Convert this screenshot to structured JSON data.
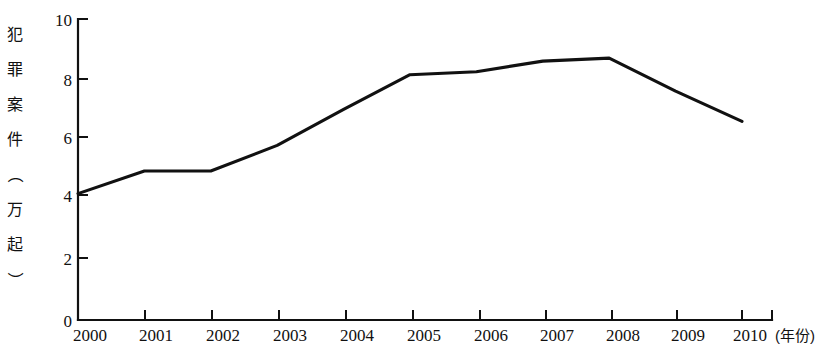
{
  "chart_data": {
    "type": "line",
    "title": "",
    "xlabel": "年份",
    "ylabel": "犯罪案件（万起）",
    "x_unit_note": "(年份)",
    "categories": [
      "2000",
      "2001",
      "2002",
      "2003",
      "2004",
      "2005",
      "2006",
      "2007",
      "2008",
      "2009",
      "2010"
    ],
    "values": [
      4.2,
      4.95,
      4.95,
      5.8,
      7.0,
      8.15,
      8.25,
      8.6,
      8.7,
      7.6,
      6.6
    ],
    "series": [
      {
        "name": "犯罪案件",
        "values": [
          4.2,
          4.95,
          4.95,
          5.8,
          7.0,
          8.15,
          8.25,
          8.6,
          8.7,
          7.6,
          6.6
        ]
      }
    ],
    "ylim": [
      0,
      10
    ],
    "y_ticks": [
      0,
      2,
      4,
      6,
      8,
      10
    ],
    "y_tick_labels": [
      "0",
      "2",
      "4",
      "6",
      "8",
      "10"
    ],
    "x_ticks": [
      "2000",
      "2001",
      "2002",
      "2003",
      "2004",
      "2005",
      "2006",
      "2007",
      "2008",
      "2009",
      "2010"
    ],
    "grid": false,
    "legend": false,
    "legend_position": "none",
    "line_color": "#111111",
    "background_color": "#ffffff"
  },
  "axis": {
    "y_label_chars": [
      "犯",
      "罪",
      "案",
      "件",
      "（",
      "万",
      "起",
      "）"
    ],
    "y_tick_0": "0",
    "y_tick_2": "2",
    "y_tick_4": "4",
    "y_tick_6": "6",
    "y_tick_8": "8",
    "y_tick_10": "10",
    "x_unit_open": "(",
    "x_unit_text": "年份",
    "x_unit_close": ")",
    "x_unit_full": "(年份)"
  },
  "x_labels": {
    "l0": "2000",
    "l1": "2001",
    "l2": "2002",
    "l3": "2003",
    "l4": "2004",
    "l5": "2005",
    "l6": "2006",
    "l7": "2007",
    "l8": "2008",
    "l9": "2009",
    "l10": "2010"
  }
}
